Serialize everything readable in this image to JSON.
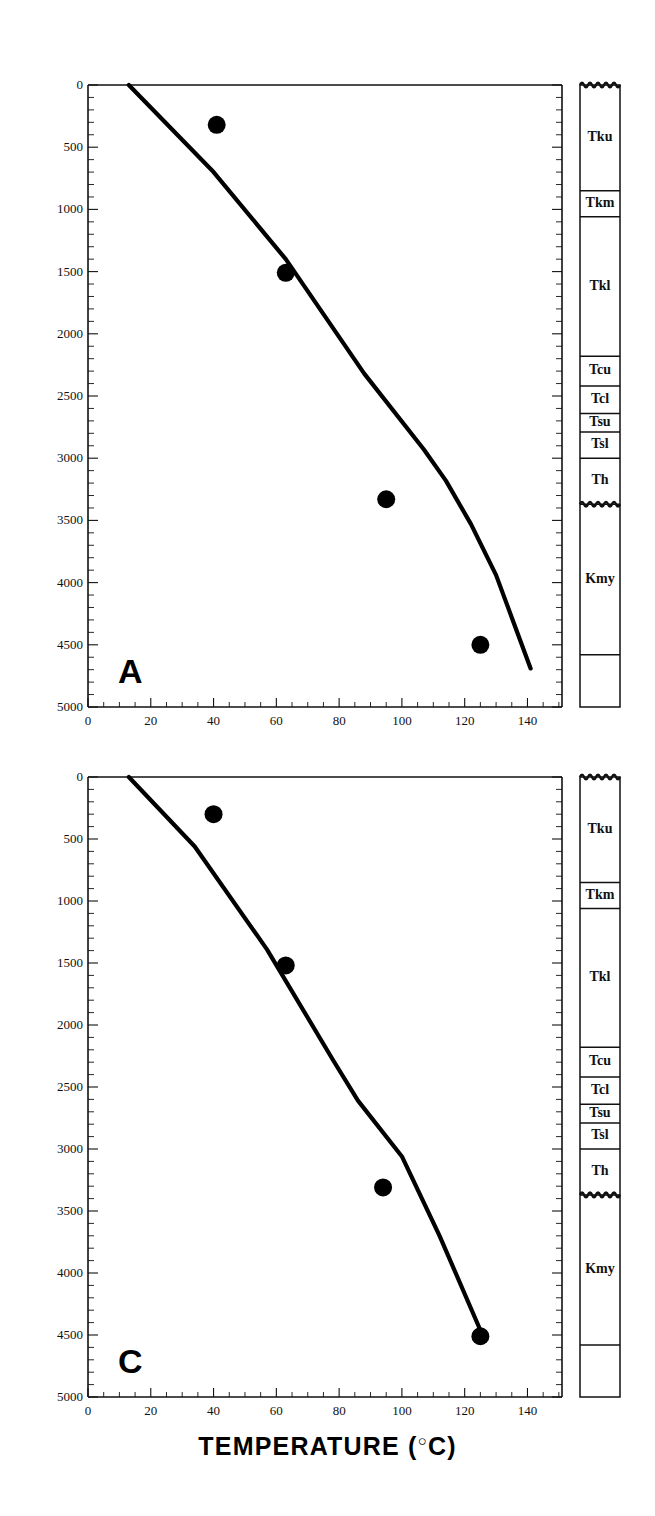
{
  "figure": {
    "axis_title_text": "TEMPERATURE (",
    "axis_title_degree": "○",
    "axis_title_unit": "C)",
    "axis_title_full": "TEMPERATURE (°C)"
  },
  "panels": [
    {
      "letter": "A",
      "x_axis": {
        "label": "TEMPERATURE (°C)",
        "ticks": [
          "0",
          "20",
          "40",
          "60",
          "80",
          "100",
          "120",
          "140"
        ],
        "tick_values": [
          0,
          20,
          40,
          60,
          80,
          100,
          120,
          140
        ],
        "min": 0,
        "max": 151
      },
      "y_axis": {
        "label": "DEPTH",
        "ticks": [
          "0",
          "500",
          "1000",
          "1500",
          "2000",
          "2500",
          "3000",
          "3500",
          "4000",
          "4500",
          "5000"
        ],
        "tick_values": [
          0,
          500,
          1000,
          1500,
          2000,
          2500,
          3000,
          3500,
          4000,
          4500,
          5000
        ],
        "min": 0,
        "max": 5000
      },
      "strat_units": [
        {
          "label": "Tku",
          "top": 0,
          "bottom": 850
        },
        {
          "label": "Tkm",
          "top": 850,
          "bottom": 1060
        },
        {
          "label": "Tkl",
          "top": 1060,
          "bottom": 2180
        },
        {
          "label": "Tcu",
          "top": 2180,
          "bottom": 2420
        },
        {
          "label": "Tcl",
          "top": 2420,
          "bottom": 2640
        },
        {
          "label": "Tsu",
          "top": 2640,
          "bottom": 2790
        },
        {
          "label": "Tsl",
          "top": 2790,
          "bottom": 3000
        },
        {
          "label": "Th",
          "top": 3000,
          "bottom": 3370
        },
        {
          "label": "Kmy",
          "top": 3370,
          "bottom": 4580
        },
        {
          "label": "",
          "top": 4580,
          "bottom": 5000
        }
      ]
    },
    {
      "letter": "C",
      "x_axis": {
        "label": "TEMPERATURE (°C)",
        "ticks": [
          "0",
          "20",
          "40",
          "60",
          "80",
          "100",
          "120",
          "140"
        ],
        "tick_values": [
          0,
          20,
          40,
          60,
          80,
          100,
          120,
          140
        ],
        "min": 0,
        "max": 151
      },
      "y_axis": {
        "label": "DEPTH",
        "ticks": [
          "0",
          "500",
          "1000",
          "1500",
          "2000",
          "2500",
          "3000",
          "3500",
          "4000",
          "4500",
          "5000"
        ],
        "tick_values": [
          0,
          500,
          1000,
          1500,
          2000,
          2500,
          3000,
          3500,
          4000,
          4500,
          5000
        ],
        "min": 0,
        "max": 5000
      },
      "strat_units": [
        {
          "label": "Tku",
          "top": 0,
          "bottom": 850
        },
        {
          "label": "Tkm",
          "top": 850,
          "bottom": 1060
        },
        {
          "label": "Tkl",
          "top": 1060,
          "bottom": 2180
        },
        {
          "label": "Tcu",
          "top": 2180,
          "bottom": 2420
        },
        {
          "label": "Tcl",
          "top": 2420,
          "bottom": 2640
        },
        {
          "label": "Tsu",
          "top": 2640,
          "bottom": 2790
        },
        {
          "label": "Tsl",
          "top": 2790,
          "bottom": 3000
        },
        {
          "label": "Th",
          "top": 3000,
          "bottom": 3370
        },
        {
          "label": "Kmy",
          "top": 3370,
          "bottom": 4580
        },
        {
          "label": "",
          "top": 4580,
          "bottom": 5000
        }
      ]
    }
  ],
  "chart_data": [
    {
      "type": "scatter",
      "panel": "A",
      "title": "A",
      "xlabel": "TEMPERATURE (°C)",
      "ylabel": "DEPTH (m)",
      "xlim": [
        0,
        151
      ],
      "ylim": [
        5000,
        0
      ],
      "grid": false,
      "legend": null,
      "series": [
        {
          "name": "measured temperature",
          "type": "scatter",
          "marker": "filled-circle",
          "color": "#000000",
          "x": [
            41,
            63,
            95,
            125
          ],
          "y": [
            320,
            1510,
            3330,
            4500
          ]
        },
        {
          "name": "modeled geotherm",
          "type": "line",
          "color": "#000000",
          "x": [
            13,
            40,
            63,
            88,
            107,
            114,
            122,
            130,
            141
          ],
          "y": [
            0,
            700,
            1400,
            2320,
            2930,
            3180,
            3530,
            3940,
            4690
          ]
        }
      ],
      "strat_column": {
        "units": [
          "Tku",
          "Tkm",
          "Tkl",
          "Tcu",
          "Tcl",
          "Tsu",
          "Tsl",
          "Th",
          "Kmy",
          ""
        ],
        "tops": [
          0,
          850,
          1060,
          2180,
          2420,
          2640,
          2790,
          3000,
          3370,
          4580
        ],
        "bottoms": [
          850,
          1060,
          2180,
          2420,
          2640,
          2790,
          3000,
          3370,
          4580,
          5000
        ],
        "unconformities": [
          0,
          3370
        ]
      }
    },
    {
      "type": "scatter",
      "panel": "C",
      "title": "C",
      "xlabel": "TEMPERATURE (°C)",
      "ylabel": "DEPTH (m)",
      "xlim": [
        0,
        151
      ],
      "ylim": [
        5000,
        0
      ],
      "grid": false,
      "legend": null,
      "series": [
        {
          "name": "measured temperature",
          "type": "scatter",
          "marker": "filled-circle",
          "color": "#000000",
          "x": [
            40,
            63,
            94,
            125
          ],
          "y": [
            300,
            1520,
            3310,
            4510
          ]
        },
        {
          "name": "modeled geotherm",
          "type": "line",
          "color": "#000000",
          "x": [
            13,
            34,
            57,
            78,
            86,
            100,
            112,
            126
          ],
          "y": [
            0,
            560,
            1390,
            2280,
            2610,
            3060,
            3700,
            4520
          ]
        }
      ],
      "strat_column": {
        "units": [
          "Tku",
          "Tkm",
          "Tkl",
          "Tcu",
          "Tcl",
          "Tsu",
          "Tsl",
          "Th",
          "Kmy",
          ""
        ],
        "tops": [
          0,
          850,
          1060,
          2180,
          2420,
          2640,
          2790,
          3000,
          3370,
          4580
        ],
        "bottoms": [
          850,
          1060,
          2180,
          2420,
          2640,
          2790,
          3000,
          3370,
          4580,
          5000
        ],
        "unconformities": [
          0,
          3370
        ]
      }
    }
  ]
}
